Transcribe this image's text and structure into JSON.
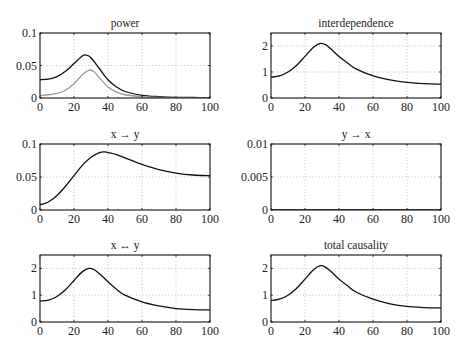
{
  "chart_data": [
    {
      "type": "line",
      "title": "power",
      "xlabel": "",
      "ylabel": "",
      "xlim": [
        0,
        100
      ],
      "ylim": [
        0,
        0.1
      ],
      "xticks": [
        0,
        20,
        40,
        60,
        80,
        100
      ],
      "yticks": [
        0,
        0.05,
        0.1
      ],
      "ytick_labels": [
        "0",
        "0.05",
        "0.1"
      ],
      "grid": true,
      "series": [
        {
          "name": "power-1",
          "color": "#111111",
          "x": [
            0,
            5,
            10,
            15,
            20,
            25,
            27,
            30,
            35,
            40,
            45,
            50,
            60,
            70,
            80,
            90,
            100
          ],
          "y": [
            0.028,
            0.029,
            0.033,
            0.041,
            0.053,
            0.065,
            0.066,
            0.062,
            0.045,
            0.028,
            0.017,
            0.01,
            0.004,
            0.002,
            0.001,
            0.0008,
            0.0005
          ]
        },
        {
          "name": "power-2",
          "color": "#999999",
          "x": [
            0,
            5,
            10,
            15,
            20,
            25,
            29,
            32,
            35,
            40,
            45,
            50,
            60,
            70,
            80,
            90,
            100
          ],
          "y": [
            0.004,
            0.005,
            0.007,
            0.012,
            0.022,
            0.036,
            0.043,
            0.04,
            0.031,
            0.017,
            0.009,
            0.005,
            0.002,
            0.001,
            0.0005,
            0.0003,
            0.0002
          ]
        }
      ]
    },
    {
      "type": "line",
      "title": "interdependence",
      "xlim": [
        0,
        100
      ],
      "ylim": [
        0,
        2.5
      ],
      "xticks": [
        0,
        20,
        40,
        60,
        80,
        100
      ],
      "yticks": [
        0,
        1,
        2
      ],
      "ytick_labels": [
        "0",
        "1",
        "2"
      ],
      "grid": true,
      "series": [
        {
          "name": "interdependence",
          "color": "#111111",
          "x": [
            0,
            5,
            10,
            15,
            20,
            25,
            29,
            32,
            35,
            40,
            45,
            50,
            60,
            70,
            80,
            90,
            100
          ],
          "y": [
            0.8,
            0.85,
            1.0,
            1.25,
            1.6,
            1.95,
            2.1,
            2.05,
            1.9,
            1.6,
            1.35,
            1.12,
            0.85,
            0.7,
            0.6,
            0.55,
            0.53
          ]
        }
      ]
    },
    {
      "type": "line",
      "title": "x → y",
      "xlim": [
        0,
        100
      ],
      "ylim": [
        0,
        0.1
      ],
      "xticks": [
        0,
        20,
        40,
        60,
        80,
        100
      ],
      "yticks": [
        0,
        0.05,
        0.1
      ],
      "ytick_labels": [
        "0",
        "0.05",
        "0.1"
      ],
      "grid": true,
      "series": [
        {
          "name": "x-to-y",
          "color": "#111111",
          "x": [
            0,
            3,
            6,
            10,
            15,
            20,
            25,
            30,
            35,
            38,
            40,
            45,
            50,
            60,
            70,
            80,
            90,
            100
          ],
          "y": [
            0.008,
            0.01,
            0.014,
            0.022,
            0.036,
            0.052,
            0.068,
            0.08,
            0.087,
            0.088,
            0.087,
            0.084,
            0.079,
            0.069,
            0.061,
            0.056,
            0.053,
            0.052
          ]
        }
      ]
    },
    {
      "type": "line",
      "title": "y → x",
      "xlim": [
        0,
        100
      ],
      "ylim": [
        0,
        0.01
      ],
      "xticks": [
        0,
        20,
        40,
        60,
        80,
        100
      ],
      "yticks": [
        0,
        0.005,
        0.01
      ],
      "ytick_labels": [
        "0",
        "0.005",
        "0.01"
      ],
      "grid": true,
      "series": [
        {
          "name": "y-to-x",
          "color": "#111111",
          "x": [
            0,
            100
          ],
          "y": [
            0,
            0
          ]
        }
      ]
    },
    {
      "type": "line",
      "title": "x ↔ y",
      "xlim": [
        0,
        100
      ],
      "ylim": [
        0,
        2.5
      ],
      "xticks": [
        0,
        20,
        40,
        60,
        80,
        100
      ],
      "yticks": [
        0,
        1,
        2
      ],
      "ytick_labels": [
        "0",
        "1",
        "2"
      ],
      "grid": true,
      "series": [
        {
          "name": "x-bidirectional-y",
          "color": "#111111",
          "x": [
            0,
            5,
            10,
            15,
            20,
            25,
            29,
            32,
            35,
            40,
            45,
            50,
            60,
            70,
            80,
            90,
            100
          ],
          "y": [
            0.78,
            0.82,
            0.95,
            1.2,
            1.55,
            1.88,
            2.0,
            1.95,
            1.8,
            1.5,
            1.22,
            1.0,
            0.75,
            0.6,
            0.5,
            0.46,
            0.45
          ]
        }
      ]
    },
    {
      "type": "line",
      "title": "total causality",
      "xlim": [
        0,
        100
      ],
      "ylim": [
        0,
        2.5
      ],
      "xticks": [
        0,
        20,
        40,
        60,
        80,
        100
      ],
      "yticks": [
        0,
        1,
        2
      ],
      "ytick_labels": [
        "0",
        "1",
        "2"
      ],
      "grid": true,
      "series": [
        {
          "name": "total-causality",
          "color": "#111111",
          "x": [
            0,
            5,
            10,
            15,
            20,
            25,
            29,
            32,
            35,
            40,
            45,
            50,
            60,
            70,
            80,
            90,
            100
          ],
          "y": [
            0.8,
            0.85,
            1.0,
            1.25,
            1.6,
            1.95,
            2.1,
            2.05,
            1.9,
            1.6,
            1.35,
            1.12,
            0.85,
            0.68,
            0.58,
            0.54,
            0.52
          ]
        }
      ]
    }
  ],
  "layout": {
    "panels": [
      {
        "left": 40,
        "top": 33,
        "width": 170,
        "height": 65
      },
      {
        "left": 271,
        "top": 33,
        "width": 170,
        "height": 65
      },
      {
        "left": 40,
        "top": 144,
        "width": 170,
        "height": 66
      },
      {
        "left": 271,
        "top": 144,
        "width": 170,
        "height": 66
      },
      {
        "left": 40,
        "top": 255,
        "width": 170,
        "height": 67
      },
      {
        "left": 271,
        "top": 255,
        "width": 170,
        "height": 67
      }
    ]
  }
}
